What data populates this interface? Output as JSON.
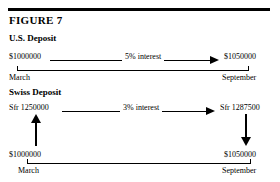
{
  "figure": {
    "title": "FIGURE 7",
    "sections": [
      {
        "heading": "U.S. Deposit",
        "start_amount": "$1000000",
        "interest_label": "5% interest",
        "end_amount": "$1050000",
        "start_period": "March",
        "end_period": "September"
      },
      {
        "heading": "Swiss Deposit",
        "start_amount": "Sfr 1250000",
        "interest_label": "3% interest",
        "end_amount": "Sfr 1287500",
        "start_period": "March",
        "end_period": "September"
      }
    ],
    "bottom_axis": {
      "start_amount": "$1000000",
      "end_amount": "$1050000",
      "start_period": "March",
      "end_period": "September"
    },
    "colors": {
      "ink": "#000000",
      "paper": "#ffffff"
    }
  }
}
